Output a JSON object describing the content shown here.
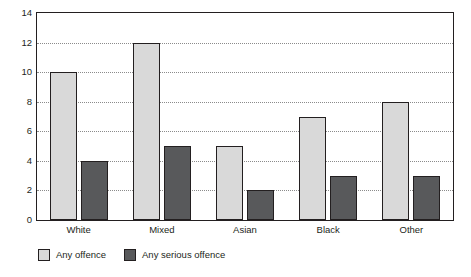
{
  "chart_data": {
    "type": "bar",
    "title": "",
    "subtitle": "",
    "xlabel": "",
    "ylabel": "",
    "categories": [
      "White",
      "Mixed",
      "Asian",
      "Black",
      "Other"
    ],
    "series": [
      {
        "name": "Any offence",
        "color": "#d9d9d9",
        "values": [
          10,
          12,
          5,
          7,
          8
        ]
      },
      {
        "name": "Any serious offence",
        "color": "#58595b",
        "values": [
          4,
          5,
          2,
          3,
          3
        ]
      }
    ],
    "ylim": [
      0,
      14
    ],
    "ytick_step": 2,
    "yticks": [
      0,
      2,
      4,
      6,
      8,
      10,
      12,
      14
    ],
    "ytick_labels": [
      "0",
      "2",
      "4",
      "6",
      "8",
      "10",
      "12",
      "14"
    ],
    "grid": true,
    "grid_axis": "y",
    "grid_style": "dotted",
    "grid_color": "#8b8b8b",
    "legend_position": "bottom-left",
    "axis_color": "#231f20",
    "background_color": "#ffffff",
    "bar_border_color": "#231f20"
  }
}
